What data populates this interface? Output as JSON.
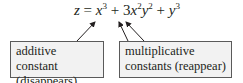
{
  "equation": {
    "lhs": "z",
    "eq": " = ",
    "t1_var": "x",
    "t1_exp": "3",
    "plus1": " + ",
    "t2_coef": "3",
    "t2_var1": "x",
    "t2_exp1": "2",
    "t2_var2": "y",
    "t2_exp2": "2",
    "plus2": " + ",
    "t3_var": "y",
    "t3_exp": "3"
  },
  "labels": {
    "left": {
      "line1": "additive constant",
      "line2": "(disappears)"
    },
    "right": {
      "line1": "multiplicative",
      "line2": "constants (reappear)"
    }
  },
  "colors": {
    "text": "#231f20",
    "box_fill": "#f2f2f2",
    "box_border": "#5a5a5a",
    "arrow": "#231f20"
  }
}
